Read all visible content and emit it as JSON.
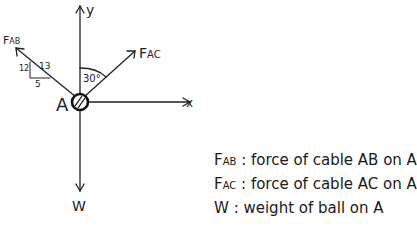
{
  "diagram": {
    "point_label": "A",
    "axes": {
      "x": "x",
      "y": "y"
    },
    "forces": {
      "fab": {
        "main": "F",
        "sub": "AB"
      },
      "fac": {
        "main": "F",
        "sub": "AC"
      },
      "w": "W"
    },
    "angle_label": "30°",
    "slope": {
      "hyp": "13",
      "opp": "12",
      "adj": "5"
    }
  },
  "legend": [
    {
      "sym": "F",
      "sub": "AB",
      "desc": ": force of cable AB on A"
    },
    {
      "sym": "F",
      "sub": "AC",
      "desc": ": force of cable AC on A"
    },
    {
      "sym": "W",
      "sub": "",
      "desc": ": weight of ball on A"
    }
  ]
}
